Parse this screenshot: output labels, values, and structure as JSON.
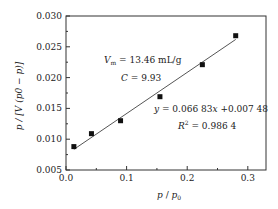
{
  "chart_data": {
    "type": "scatter",
    "title": "",
    "xlabel": "p / p0",
    "ylabel": "p / [V (p0 - p)]",
    "xlim": [
      0.0,
      0.33
    ],
    "ylim": [
      0.005,
      0.03
    ],
    "x_ticks": [
      "0.0",
      "0.1",
      "0.2",
      "0.3"
    ],
    "y_ticks": [
      "0.005",
      "0.010",
      "0.015",
      "0.020",
      "0.025",
      "0.030"
    ],
    "grid": false,
    "legend": null,
    "series": [
      {
        "name": "data",
        "marker": "square",
        "x": [
          0.013,
          0.042,
          0.09,
          0.155,
          0.225,
          0.28
        ],
        "y": [
          0.0088,
          0.0109,
          0.013,
          0.0169,
          0.0221,
          0.0268
        ]
      },
      {
        "name": "linear fit",
        "type": "line",
        "slope": 0.06683,
        "intercept": 0.00748,
        "x_range": [
          0.013,
          0.28
        ]
      }
    ],
    "annotations": [
      {
        "text": "Vm = 13.46 mL/g",
        "x": 0.09,
        "y": 0.0215
      },
      {
        "text": "C = 9.93",
        "x": 0.115,
        "y": 0.0187
      },
      {
        "text": "y = 0.066 83x + 0.007 48",
        "x": 0.15,
        "y": 0.0143
      },
      {
        "text": "R² = 0.986 4",
        "x": 0.17,
        "y": 0.0118
      }
    ]
  },
  "labels": {
    "x_axis_title_p": "p",
    "x_axis_title_sep": " / ",
    "x_axis_title_p0": "p",
    "x_axis_title_sub": "0",
    "y_axis_title": "p / [V (p0 − p)]",
    "vm_label": "V",
    "vm_sub": "m",
    "vm_value": " = 13.46 mL/g",
    "c_label": "C",
    "c_value": " = 9.93",
    "eq_y": "y",
    "eq_mid": " = 0.066 83",
    "eq_x": "x",
    "eq_end": " +0.007 48",
    "r2_label": "R",
    "r2_sup": "2",
    "r2_value": " = 0.986 4"
  }
}
